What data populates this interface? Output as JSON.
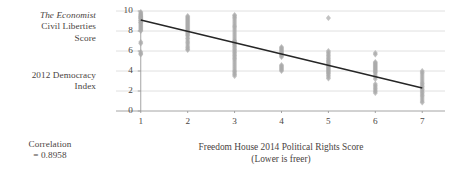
{
  "labels": {
    "y_axis_source": "The Economist",
    "y_axis_line2": "Civil Liberties",
    "y_axis_line3": "Score",
    "y_axis_group2_line1": "2012 Democracy",
    "y_axis_group2_line2": "Index",
    "correlation_line1": "Correlation",
    "correlation_line2": "= 0.8958"
  },
  "chart_data": {
    "type": "scatter",
    "title": "",
    "xlabel": "Freedom House 2014 Political Rights Score",
    "xlabel_sub": "(Lower is freer)",
    "ylabel": "The Economist Civil Liberties Score / 2012 Democracy Index",
    "xlim": [
      0.6,
      7.4
    ],
    "ylim": [
      0,
      10
    ],
    "xticks": [
      1,
      2,
      3,
      4,
      5,
      6,
      7
    ],
    "yticks": [
      0,
      2,
      4,
      6,
      8,
      10
    ],
    "grid": "horizontal",
    "legend": "none",
    "correlation": -0.8958,
    "correlation_label": "= 0.8958",
    "marker_color": "#aaaaaa",
    "trendline_color": "#262626",
    "gridline_color": "#d8d8d8",
    "axis_color": "#9a9a9a",
    "trendline": {
      "x": [
        1,
        7
      ],
      "y": [
        9.1,
        2.3
      ]
    },
    "points": [
      {
        "x": 1,
        "y": 9.9
      },
      {
        "x": 1,
        "y": 9.8
      },
      {
        "x": 1,
        "y": 9.7
      },
      {
        "x": 1,
        "y": 9.65
      },
      {
        "x": 1,
        "y": 9.55
      },
      {
        "x": 1,
        "y": 9.5
      },
      {
        "x": 1,
        "y": 9.45
      },
      {
        "x": 1,
        "y": 9.4
      },
      {
        "x": 1,
        "y": 9.35
      },
      {
        "x": 1,
        "y": 9.3
      },
      {
        "x": 1,
        "y": 9.25
      },
      {
        "x": 1,
        "y": 9.2
      },
      {
        "x": 1,
        "y": 9.1
      },
      {
        "x": 1,
        "y": 9.05
      },
      {
        "x": 1,
        "y": 9.0
      },
      {
        "x": 1,
        "y": 8.9
      },
      {
        "x": 1,
        "y": 8.85
      },
      {
        "x": 1,
        "y": 8.8
      },
      {
        "x": 1,
        "y": 8.7
      },
      {
        "x": 1,
        "y": 8.6
      },
      {
        "x": 1,
        "y": 8.5
      },
      {
        "x": 1,
        "y": 8.4
      },
      {
        "x": 1,
        "y": 8.3
      },
      {
        "x": 1,
        "y": 8.2
      },
      {
        "x": 1,
        "y": 8.1
      },
      {
        "x": 1,
        "y": 8.0
      },
      {
        "x": 1,
        "y": 6.9
      },
      {
        "x": 1,
        "y": 6.75
      },
      {
        "x": 1,
        "y": 5.9
      },
      {
        "x": 1,
        "y": 5.75
      },
      {
        "x": 1,
        "y": 5.65
      },
      {
        "x": 2,
        "y": 9.5
      },
      {
        "x": 2,
        "y": 9.4
      },
      {
        "x": 2,
        "y": 9.3
      },
      {
        "x": 2,
        "y": 9.2
      },
      {
        "x": 2,
        "y": 9.1
      },
      {
        "x": 2,
        "y": 9.0
      },
      {
        "x": 2,
        "y": 8.9
      },
      {
        "x": 2,
        "y": 8.8
      },
      {
        "x": 2,
        "y": 8.7
      },
      {
        "x": 2,
        "y": 8.6
      },
      {
        "x": 2,
        "y": 8.5
      },
      {
        "x": 2,
        "y": 8.4
      },
      {
        "x": 2,
        "y": 8.3
      },
      {
        "x": 2,
        "y": 8.2
      },
      {
        "x": 2,
        "y": 8.1
      },
      {
        "x": 2,
        "y": 8.0
      },
      {
        "x": 2,
        "y": 7.9
      },
      {
        "x": 2,
        "y": 7.8
      },
      {
        "x": 2,
        "y": 7.7
      },
      {
        "x": 2,
        "y": 7.6
      },
      {
        "x": 2,
        "y": 7.5
      },
      {
        "x": 2,
        "y": 7.3
      },
      {
        "x": 2,
        "y": 7.2
      },
      {
        "x": 2,
        "y": 7.0
      },
      {
        "x": 2,
        "y": 6.85
      },
      {
        "x": 2,
        "y": 6.7
      },
      {
        "x": 2,
        "y": 6.5
      },
      {
        "x": 2,
        "y": 6.35
      },
      {
        "x": 2,
        "y": 6.2
      },
      {
        "x": 2,
        "y": 6.1
      },
      {
        "x": 3,
        "y": 9.6
      },
      {
        "x": 3,
        "y": 9.5
      },
      {
        "x": 3,
        "y": 9.35
      },
      {
        "x": 3,
        "y": 9.2
      },
      {
        "x": 3,
        "y": 9.0
      },
      {
        "x": 3,
        "y": 8.8
      },
      {
        "x": 3,
        "y": 8.6
      },
      {
        "x": 3,
        "y": 8.45
      },
      {
        "x": 3,
        "y": 8.3
      },
      {
        "x": 3,
        "y": 8.1
      },
      {
        "x": 3,
        "y": 7.9
      },
      {
        "x": 3,
        "y": 7.7
      },
      {
        "x": 3,
        "y": 7.5
      },
      {
        "x": 3,
        "y": 7.3
      },
      {
        "x": 3,
        "y": 7.1
      },
      {
        "x": 3,
        "y": 7.0
      },
      {
        "x": 3,
        "y": 6.9
      },
      {
        "x": 3,
        "y": 6.8
      },
      {
        "x": 3,
        "y": 6.7
      },
      {
        "x": 3,
        "y": 6.6
      },
      {
        "x": 3,
        "y": 6.45
      },
      {
        "x": 3,
        "y": 6.3
      },
      {
        "x": 3,
        "y": 6.15
      },
      {
        "x": 3,
        "y": 6.0
      },
      {
        "x": 3,
        "y": 5.85
      },
      {
        "x": 3,
        "y": 5.7
      },
      {
        "x": 3,
        "y": 5.55
      },
      {
        "x": 3,
        "y": 5.4
      },
      {
        "x": 3,
        "y": 5.25
      },
      {
        "x": 3,
        "y": 5.1
      },
      {
        "x": 3,
        "y": 4.9
      },
      {
        "x": 3,
        "y": 4.7
      },
      {
        "x": 3,
        "y": 4.5
      },
      {
        "x": 3,
        "y": 4.3
      },
      {
        "x": 3,
        "y": 4.1
      },
      {
        "x": 3,
        "y": 3.95
      },
      {
        "x": 3,
        "y": 3.8
      },
      {
        "x": 3,
        "y": 3.65
      },
      {
        "x": 3,
        "y": 3.5
      },
      {
        "x": 4,
        "y": 6.4
      },
      {
        "x": 4,
        "y": 6.3
      },
      {
        "x": 4,
        "y": 6.2
      },
      {
        "x": 4,
        "y": 6.1
      },
      {
        "x": 4,
        "y": 6.0
      },
      {
        "x": 4,
        "y": 5.9
      },
      {
        "x": 4,
        "y": 5.8
      },
      {
        "x": 4,
        "y": 5.7
      },
      {
        "x": 4,
        "y": 5.6
      },
      {
        "x": 4,
        "y": 5.5
      },
      {
        "x": 4,
        "y": 5.4
      },
      {
        "x": 4,
        "y": 4.6
      },
      {
        "x": 4,
        "y": 4.5
      },
      {
        "x": 4,
        "y": 4.4
      },
      {
        "x": 4,
        "y": 4.3
      },
      {
        "x": 4,
        "y": 4.2
      },
      {
        "x": 4,
        "y": 4.1
      },
      {
        "x": 4,
        "y": 4.0
      },
      {
        "x": 5,
        "y": 9.3
      },
      {
        "x": 5,
        "y": 6.0
      },
      {
        "x": 5,
        "y": 5.85
      },
      {
        "x": 5,
        "y": 5.7
      },
      {
        "x": 5,
        "y": 5.55
      },
      {
        "x": 5,
        "y": 5.4
      },
      {
        "x": 5,
        "y": 5.25
      },
      {
        "x": 5,
        "y": 5.1
      },
      {
        "x": 5,
        "y": 5.0
      },
      {
        "x": 5,
        "y": 4.9
      },
      {
        "x": 5,
        "y": 4.8
      },
      {
        "x": 5,
        "y": 4.7
      },
      {
        "x": 5,
        "y": 4.6
      },
      {
        "x": 5,
        "y": 4.5
      },
      {
        "x": 5,
        "y": 4.4
      },
      {
        "x": 5,
        "y": 4.3
      },
      {
        "x": 5,
        "y": 4.2
      },
      {
        "x": 5,
        "y": 4.1
      },
      {
        "x": 5,
        "y": 4.0
      },
      {
        "x": 5,
        "y": 3.9
      },
      {
        "x": 5,
        "y": 3.8
      },
      {
        "x": 5,
        "y": 3.7
      },
      {
        "x": 5,
        "y": 3.55
      },
      {
        "x": 5,
        "y": 3.4
      },
      {
        "x": 5,
        "y": 3.25
      },
      {
        "x": 6,
        "y": 5.8
      },
      {
        "x": 6,
        "y": 5.65
      },
      {
        "x": 6,
        "y": 4.9
      },
      {
        "x": 6,
        "y": 4.8
      },
      {
        "x": 6,
        "y": 4.7
      },
      {
        "x": 6,
        "y": 4.6
      },
      {
        "x": 6,
        "y": 4.5
      },
      {
        "x": 6,
        "y": 4.4
      },
      {
        "x": 6,
        "y": 4.3
      },
      {
        "x": 6,
        "y": 4.2
      },
      {
        "x": 6,
        "y": 4.1
      },
      {
        "x": 6,
        "y": 4.0
      },
      {
        "x": 6,
        "y": 3.9
      },
      {
        "x": 6,
        "y": 3.8
      },
      {
        "x": 6,
        "y": 3.6
      },
      {
        "x": 6,
        "y": 3.4
      },
      {
        "x": 6,
        "y": 3.2
      },
      {
        "x": 6,
        "y": 2.7
      },
      {
        "x": 6,
        "y": 2.55
      },
      {
        "x": 6,
        "y": 2.4
      },
      {
        "x": 6,
        "y": 2.25
      },
      {
        "x": 6,
        "y": 2.1
      },
      {
        "x": 6,
        "y": 1.95
      },
      {
        "x": 6,
        "y": 1.8
      },
      {
        "x": 7,
        "y": 4.0
      },
      {
        "x": 7,
        "y": 3.85
      },
      {
        "x": 7,
        "y": 3.7
      },
      {
        "x": 7,
        "y": 3.5
      },
      {
        "x": 7,
        "y": 3.3
      },
      {
        "x": 7,
        "y": 3.1
      },
      {
        "x": 7,
        "y": 2.9
      },
      {
        "x": 7,
        "y": 2.75
      },
      {
        "x": 7,
        "y": 2.6
      },
      {
        "x": 7,
        "y": 2.45
      },
      {
        "x": 7,
        "y": 2.3
      },
      {
        "x": 7,
        "y": 2.15
      },
      {
        "x": 7,
        "y": 2.0
      },
      {
        "x": 7,
        "y": 1.85
      },
      {
        "x": 7,
        "y": 1.7
      },
      {
        "x": 7,
        "y": 1.55
      },
      {
        "x": 7,
        "y": 1.4
      },
      {
        "x": 7,
        "y": 1.2
      },
      {
        "x": 7,
        "y": 1.0
      },
      {
        "x": 7,
        "y": 0.85
      }
    ]
  }
}
